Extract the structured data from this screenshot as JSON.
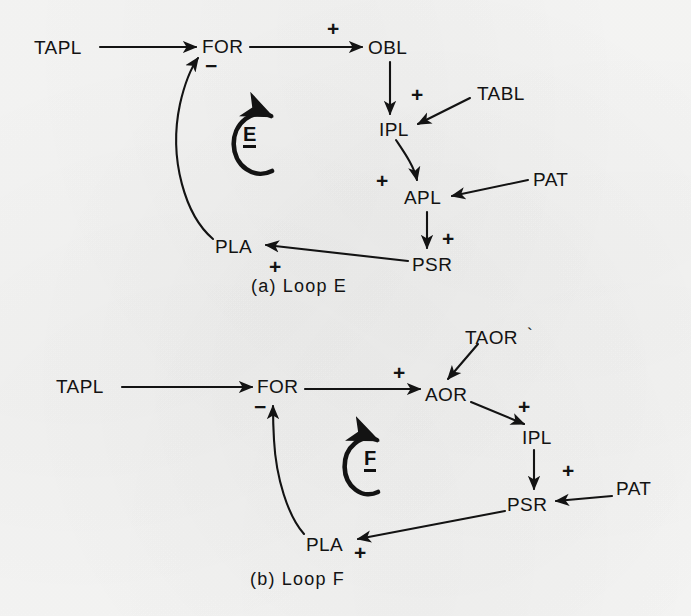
{
  "figure": {
    "background_color": "#f7f7f6",
    "ink_color": "#131313",
    "panels": [
      {
        "id": "a",
        "caption": "(a)  Loop  E",
        "loop_marker": "E",
        "loop_direction": "clockwise",
        "nodes": [
          {
            "id": "tapl_a",
            "label": "TAPL",
            "x": 34,
            "y": 38
          },
          {
            "id": "for_a",
            "label": "FOR",
            "x": 202,
            "y": 37
          },
          {
            "id": "obl_a",
            "label": "OBL",
            "x": 368,
            "y": 38
          },
          {
            "id": "tabl_a",
            "label": "TABL",
            "x": 477,
            "y": 84
          },
          {
            "id": "ipl_a",
            "label": "IPL",
            "x": 379,
            "y": 120
          },
          {
            "id": "pat_a",
            "label": "PAT",
            "x": 533,
            "y": 170
          },
          {
            "id": "apl_a",
            "label": "APL",
            "x": 404,
            "y": 188
          },
          {
            "id": "pla_a",
            "label": "PLA",
            "x": 215,
            "y": 237
          },
          {
            "id": "psr_a",
            "label": "PSR",
            "x": 412,
            "y": 255
          }
        ],
        "signs": [
          {
            "id": "sign-for-obl",
            "label": "+",
            "x": 327,
            "y": 18
          },
          {
            "id": "sign-pla-for",
            "label": "−",
            "x": 205,
            "y": 55
          },
          {
            "id": "sign-tabl-ipl",
            "label": "+",
            "x": 411,
            "y": 84
          },
          {
            "id": "sign-ipl-apl",
            "label": "+",
            "x": 376,
            "y": 170
          },
          {
            "id": "sign-apl-psr",
            "label": "+",
            "x": 442,
            "y": 228
          },
          {
            "id": "sign-psr-pla",
            "label": "+",
            "x": 269,
            "y": 256
          }
        ],
        "edges": [
          {
            "id": "tapl-to-for",
            "from": "TAPL",
            "to": "FOR",
            "sign": "",
            "shape": "straight"
          },
          {
            "id": "for-to-obl",
            "from": "FOR",
            "to": "OBL",
            "sign": "+",
            "shape": "straight"
          },
          {
            "id": "obl-to-ipl",
            "from": "OBL",
            "to": "IPL",
            "sign": "",
            "shape": "straight"
          },
          {
            "id": "tabl-to-ipl",
            "from": "TABL",
            "to": "IPL",
            "sign": "+",
            "shape": "straight"
          },
          {
            "id": "ipl-to-apl",
            "from": "IPL",
            "to": "APL",
            "sign": "+",
            "shape": "curved"
          },
          {
            "id": "pat-to-apl",
            "from": "PAT",
            "to": "APL",
            "sign": "",
            "shape": "straight"
          },
          {
            "id": "apl-to-psr",
            "from": "APL",
            "to": "PSR",
            "sign": "+",
            "shape": "straight"
          },
          {
            "id": "psr-to-pla",
            "from": "PSR",
            "to": "PLA",
            "sign": "+",
            "shape": "straight"
          },
          {
            "id": "pla-to-for",
            "from": "PLA",
            "to": "FOR",
            "sign": "−",
            "shape": "curved"
          }
        ]
      },
      {
        "id": "b",
        "caption": "(b)  Loop  F",
        "loop_marker": "F",
        "loop_direction": "clockwise",
        "nodes": [
          {
            "id": "tapl_b",
            "label": "TAPL",
            "x": 56,
            "y": 377
          },
          {
            "id": "for_b",
            "label": "FOR",
            "x": 257,
            "y": 377
          },
          {
            "id": "taor_b",
            "label": "TAOR",
            "x": 465,
            "y": 328,
            "mark": "`"
          },
          {
            "id": "aor_b",
            "label": "AOR",
            "x": 425,
            "y": 385
          },
          {
            "id": "ipl_b",
            "label": "IPL",
            "x": 522,
            "y": 428
          },
          {
            "id": "pat_b",
            "label": "PAT",
            "x": 616,
            "y": 479
          },
          {
            "id": "psr_b",
            "label": "PSR",
            "x": 507,
            "y": 495
          },
          {
            "id": "pla_b",
            "label": "PLA",
            "x": 306,
            "y": 535
          }
        ],
        "signs": [
          {
            "id": "sign-for-aor-b",
            "label": "+",
            "x": 393,
            "y": 362
          },
          {
            "id": "sign-pla-for-b",
            "label": "−",
            "x": 254,
            "y": 396
          },
          {
            "id": "sign-aor-ipl-b",
            "label": "+",
            "x": 518,
            "y": 396
          },
          {
            "id": "sign-ipl-psr-b",
            "label": "+",
            "x": 562,
            "y": 460
          },
          {
            "id": "sign-psr-pla-b",
            "label": "+",
            "x": 354,
            "y": 542
          }
        ],
        "edges": [
          {
            "id": "tapl-to-for-b",
            "from": "TAPL",
            "to": "FOR",
            "sign": "",
            "shape": "straight"
          },
          {
            "id": "for-to-aor-b",
            "from": "FOR",
            "to": "AOR",
            "sign": "+",
            "shape": "straight"
          },
          {
            "id": "taor-to-aor-b",
            "from": "TAOR",
            "to": "AOR",
            "sign": "",
            "shape": "straight"
          },
          {
            "id": "aor-to-ipl-b",
            "from": "AOR",
            "to": "IPL",
            "sign": "+",
            "shape": "straight"
          },
          {
            "id": "ipl-to-psr-b",
            "from": "IPL",
            "to": "PSR",
            "sign": "+",
            "shape": "straight"
          },
          {
            "id": "pat-to-psr-b",
            "from": "PAT",
            "to": "PSR",
            "sign": "",
            "shape": "straight"
          },
          {
            "id": "psr-to-pla-b",
            "from": "PSR",
            "to": "PLA",
            "sign": "+",
            "shape": "straight"
          },
          {
            "id": "pla-to-for-b",
            "from": "PLA",
            "to": "FOR",
            "sign": "−",
            "shape": "curved"
          }
        ]
      }
    ]
  }
}
